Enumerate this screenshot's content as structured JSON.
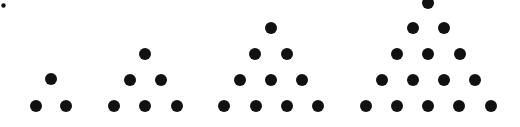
{
  "figure": {
    "background": "#ffffff",
    "dot_color": "#111111",
    "dot_radius": 6,
    "small_dot": {
      "cx": 3.5,
      "cy": 5.5,
      "r": 2.2
    },
    "groups": [
      {
        "name": "triangle-3",
        "count": 3,
        "dots": [
          [
            51,
            79
          ],
          [
            36,
            106
          ],
          [
            66,
            106
          ]
        ]
      },
      {
        "name": "triangle-6",
        "count": 6,
        "dots": [
          [
            145,
            54
          ],
          [
            130,
            80
          ],
          [
            161,
            80
          ],
          [
            114,
            106
          ],
          [
            145,
            106
          ],
          [
            177,
            106
          ]
        ]
      },
      {
        "name": "triangle-10",
        "count": 10,
        "dots": [
          [
            271,
            28
          ],
          [
            255,
            54
          ],
          [
            287,
            54
          ],
          [
            240,
            80
          ],
          [
            271,
            80
          ],
          [
            302,
            80
          ],
          [
            224,
            106
          ],
          [
            256,
            106
          ],
          [
            287,
            106
          ],
          [
            318,
            106
          ]
        ]
      },
      {
        "name": "triangle-15",
        "count": 15,
        "dots": [
          [
            428,
            3
          ],
          [
            413,
            28
          ],
          [
            444,
            28
          ],
          [
            397,
            54
          ],
          [
            428,
            54
          ],
          [
            460,
            54
          ],
          [
            382,
            80
          ],
          [
            413,
            80
          ],
          [
            444,
            80
          ],
          [
            475,
            80
          ],
          [
            366,
            106
          ],
          [
            397,
            106
          ],
          [
            428,
            106
          ],
          [
            459,
            106
          ],
          [
            491,
            106
          ]
        ]
      }
    ]
  }
}
